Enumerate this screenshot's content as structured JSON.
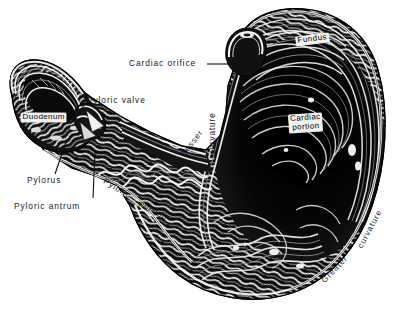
{
  "figure": {
    "background_color": "#ffffff",
    "ink_color": "#111111",
    "width": 403,
    "height": 309
  },
  "labels": {
    "cardiac_orifice": "Cardiac orifice",
    "pyloric_valve": "Pyloric valve",
    "duodenum": "Duodenum",
    "pylorus": "Pylorus",
    "pyloric_antrum": "Pyloric antrum",
    "fundus": "Fundus",
    "cardiac_portion_line1": "Cardiac",
    "cardiac_portion_line2": "portion",
    "lesser": "Lesser",
    "curvature_lesser": "curvature",
    "greater": "Greater",
    "curvature_greater": "curvature",
    "pyloric_portion_word1": "Pyloric",
    "pyloric_portion_word2": "portion"
  }
}
